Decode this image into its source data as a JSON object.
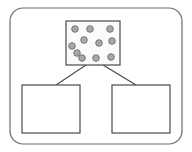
{
  "canvas": {
    "width": 192,
    "height": 152,
    "background": "#ffffff"
  },
  "colors": {
    "outline_dark": "#3a3a3a",
    "outline_mid": "#555555",
    "outline_light": "#8d8d8d",
    "box_fill": "#ffffff",
    "source_box_fill": "#fcfcfc",
    "dot_fill": "#a8a8a8",
    "dot_stroke": "#6e6e6e",
    "connector_stroke": "#4a4a4a"
  },
  "container": {
    "shape": "rounded-rectangle",
    "x": 10,
    "y": 8,
    "width": 172,
    "height": 136,
    "corner_radius": 13,
    "stroke": "#6b6b6b",
    "stroke_width": 1.2,
    "fill": "#ffffff",
    "label": ""
  },
  "source_node": {
    "shape": "rectangle",
    "x": 66,
    "y": 21,
    "width": 54,
    "height": 44,
    "stroke": "#4a4a4a",
    "stroke_width": 1.2,
    "fill": "#fbfbfb",
    "label": "",
    "dot_count": 11,
    "dots": [
      {
        "cx": 75,
        "cy": 29,
        "r": 3.3
      },
      {
        "cx": 90,
        "cy": 29,
        "r": 3.3
      },
      {
        "cx": 110,
        "cy": 29,
        "r": 3.3
      },
      {
        "cx": 84,
        "cy": 40,
        "r": 3.3
      },
      {
        "cx": 99,
        "cy": 43,
        "r": 3.3
      },
      {
        "cx": 112,
        "cy": 41,
        "r": 3.3
      },
      {
        "cx": 72,
        "cy": 46,
        "r": 3.3
      },
      {
        "cx": 77,
        "cy": 53,
        "r": 3.3
      },
      {
        "cx": 82,
        "cy": 58,
        "r": 3.3
      },
      {
        "cx": 96,
        "cy": 58,
        "r": 3.3
      },
      {
        "cx": 111,
        "cy": 57,
        "r": 3.3
      }
    ]
  },
  "target_nodes": [
    {
      "id": "left",
      "shape": "rectangle",
      "x": 22,
      "y": 85,
      "width": 58,
      "height": 48,
      "stroke": "#4a4a4a",
      "stroke_width": 1.2,
      "fill": "#ffffff",
      "label": ""
    },
    {
      "id": "right",
      "shape": "rectangle",
      "x": 112,
      "y": 85,
      "width": 58,
      "height": 48,
      "stroke": "#4a4a4a",
      "stroke_width": 1.2,
      "fill": "#ffffff",
      "label": ""
    }
  ],
  "connectors": [
    {
      "id": "source-to-left",
      "from": "source_node",
      "to": "left",
      "x1": 86,
      "y1": 65,
      "x2": 56,
      "y2": 85,
      "stroke": "#4a4a4a",
      "stroke_width": 1.2,
      "label": ""
    },
    {
      "id": "source-to-right",
      "from": "source_node",
      "to": "right",
      "x1": 103,
      "y1": 65,
      "x2": 136,
      "y2": 85,
      "stroke": "#4a4a4a",
      "stroke_width": 1.2,
      "label": ""
    }
  ]
}
